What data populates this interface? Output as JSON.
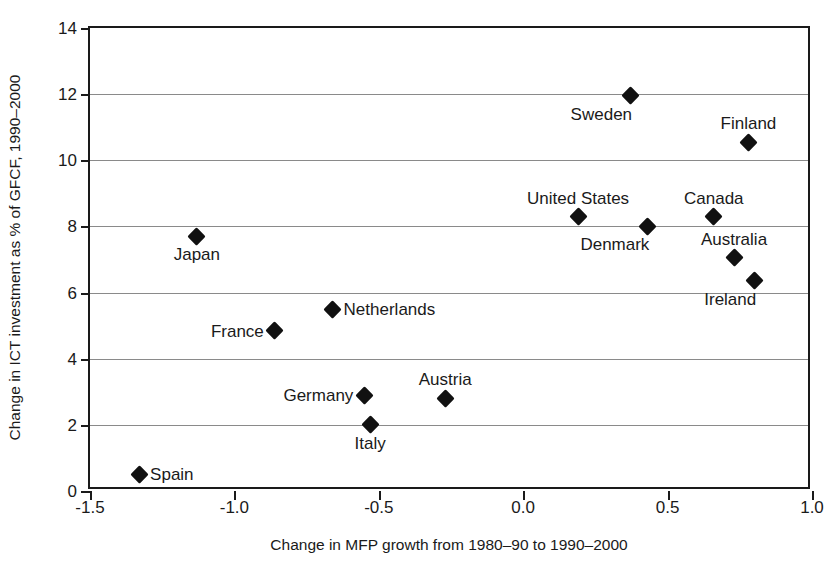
{
  "chart_data": {
    "type": "scatter",
    "title": "",
    "xlabel": "Change in MFP growth from 1980–90 to 1990–2000",
    "ylabel": "Change in ICT investment as % of GFCF, 1990–2000",
    "xlim": [
      -1.5,
      1.0
    ],
    "ylim": [
      0,
      14
    ],
    "xticks": [
      "-1.5",
      "-1.0",
      "-0.5",
      "0.0",
      "0.5",
      "1.0"
    ],
    "xtick_values": [
      -1.5,
      -1.0,
      -0.5,
      0.0,
      0.5,
      1.0
    ],
    "yticks": [
      "0",
      "2",
      "4",
      "6",
      "8",
      "10",
      "12",
      "14"
    ],
    "ytick_values": [
      0,
      2,
      4,
      6,
      8,
      10,
      12,
      14
    ],
    "grid": "horizontal",
    "legend": "none",
    "marker": "filled-diamond",
    "marker_color": "#111111",
    "points": [
      {
        "label": "Sweden",
        "x": 0.37,
        "y": 11.95,
        "label_pos": "below-left"
      },
      {
        "label": "Finland",
        "x": 0.78,
        "y": 10.55,
        "label_pos": "above"
      },
      {
        "label": "United States",
        "x": 0.19,
        "y": 8.3,
        "label_pos": "above"
      },
      {
        "label": "Canada",
        "x": 0.66,
        "y": 8.3,
        "label_pos": "above"
      },
      {
        "label": "Denmark",
        "x": 0.43,
        "y": 8.0,
        "label_pos": "below-left"
      },
      {
        "label": "Japan",
        "x": -1.13,
        "y": 7.7,
        "label_pos": "below"
      },
      {
        "label": "Australia",
        "x": 0.73,
        "y": 7.05,
        "label_pos": "above"
      },
      {
        "label": "Ireland",
        "x": 0.8,
        "y": 6.35,
        "label_pos": "below-left"
      },
      {
        "label": "Netherlands",
        "x": -0.66,
        "y": 5.5,
        "label_pos": "right"
      },
      {
        "label": "France",
        "x": -0.86,
        "y": 4.85,
        "label_pos": "left"
      },
      {
        "label": "Germany",
        "x": -0.55,
        "y": 2.9,
        "label_pos": "left"
      },
      {
        "label": "Austria",
        "x": -0.27,
        "y": 2.8,
        "label_pos": "above"
      },
      {
        "label": "Italy",
        "x": -0.53,
        "y": 2.0,
        "label_pos": "below"
      },
      {
        "label": "Spain",
        "x": -1.33,
        "y": 0.5,
        "label_pos": "right"
      }
    ]
  }
}
